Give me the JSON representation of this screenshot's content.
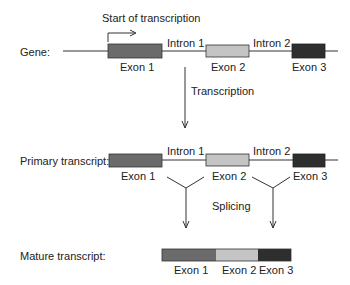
{
  "colors": {
    "exon1": "#6b6b6b",
    "exon2": "#c4c4c4",
    "exon3": "#2e2e2e",
    "line": "#333333"
  },
  "gene": {
    "label": "Gene:",
    "start_label": "Start of transcription",
    "exons": [
      "Exon 1",
      "Exon 2",
      "Exon 3"
    ],
    "introns": [
      "Intron 1",
      "Intron 2"
    ]
  },
  "step1": {
    "label": "Transcription"
  },
  "primary": {
    "label": "Primary transcript:",
    "exons": [
      "Exon 1",
      "Exon 2",
      "Exon 3"
    ],
    "introns": [
      "Intron 1",
      "Intron 2"
    ]
  },
  "step2": {
    "label": "Splicing"
  },
  "mature": {
    "label": "Mature transcript:",
    "exons": [
      "Exon 1",
      "Exon 2",
      "Exon 3"
    ]
  }
}
